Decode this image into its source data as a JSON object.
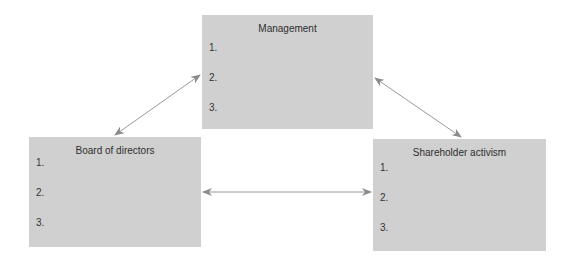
{
  "diagram": {
    "nodes": [
      {
        "id": "management",
        "title": "Management",
        "items": [
          "1.",
          "2.",
          "3."
        ]
      },
      {
        "id": "board",
        "title": "Board of directors",
        "items": [
          "1.",
          "2.",
          "3."
        ]
      },
      {
        "id": "shareholder",
        "title": "Shareholder activism",
        "items": [
          "1.",
          "2.",
          "3."
        ]
      }
    ],
    "edges": [
      {
        "from": "board",
        "to": "management",
        "type": "bidirectional"
      },
      {
        "from": "management",
        "to": "shareholder",
        "type": "bidirectional"
      },
      {
        "from": "board",
        "to": "shareholder",
        "type": "bidirectional"
      }
    ],
    "colors": {
      "box_fill": "#d0d0d0",
      "text": "#333333",
      "arrow": "#8a8a8a",
      "background": "#ffffff"
    }
  }
}
